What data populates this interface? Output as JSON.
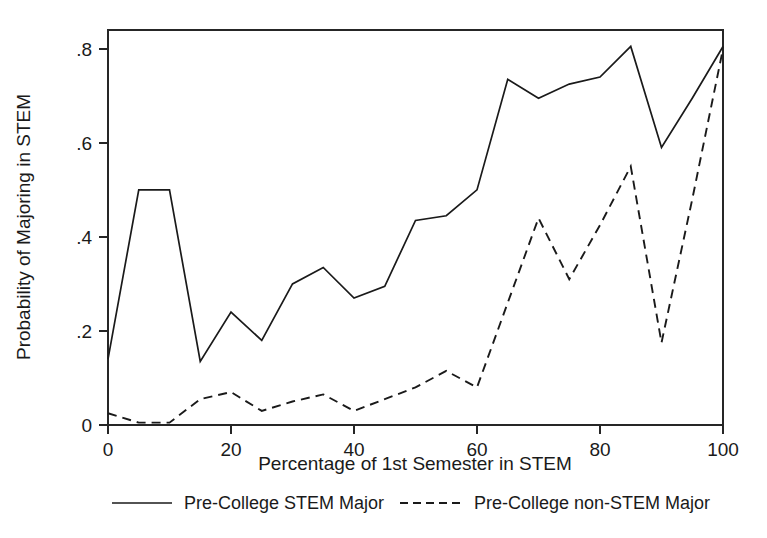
{
  "chart_data": {
    "type": "line",
    "title": "",
    "xlabel": "Percentage of 1st Semester in STEM",
    "ylabel": "Probability of Majoring in STEM",
    "xlim": [
      0,
      100
    ],
    "ylim": [
      0,
      0.84
    ],
    "grid": false,
    "legend_position": "bottom",
    "xticks": [
      0,
      20,
      40,
      60,
      80,
      100
    ],
    "xtick_labels": [
      "0",
      "20",
      "40",
      "60",
      "80",
      "100"
    ],
    "yticks": [
      0,
      0.2,
      0.4,
      0.6,
      0.8
    ],
    "ytick_labels": [
      "0",
      ".2",
      ".4",
      ".6",
      ".8"
    ],
    "x": [
      0,
      5,
      10,
      15,
      20,
      25,
      30,
      35,
      40,
      45,
      50,
      55,
      60,
      65,
      70,
      75,
      80,
      85,
      90,
      95,
      100
    ],
    "series": [
      {
        "name": "Pre-College STEM Major",
        "style": "solid",
        "values": [
          0.14,
          0.5,
          0.5,
          0.135,
          0.24,
          0.18,
          0.3,
          0.335,
          0.27,
          0.295,
          0.435,
          0.445,
          0.5,
          0.735,
          0.695,
          0.725,
          0.74,
          0.805,
          0.59,
          0.695,
          0.805
        ]
      },
      {
        "name": "Pre-College non-STEM Major",
        "style": "dashed",
        "values": [
          0.025,
          0.005,
          0.005,
          0.055,
          0.07,
          0.03,
          0.05,
          0.065,
          0.03,
          0.055,
          0.08,
          0.115,
          0.08,
          0.26,
          0.44,
          0.31,
          0.425,
          0.55,
          0.175,
          0.48,
          0.8
        ]
      }
    ]
  },
  "legend": {
    "entries": [
      {
        "label": "Pre-College STEM Major",
        "key": "solid-line-key"
      },
      {
        "label": "Pre-College non-STEM Major",
        "key": "dashed-line-key"
      }
    ]
  },
  "axes": {
    "x_title": "Percentage of 1st Semester in STEM",
    "y_title": "Probability of Majoring in STEM"
  }
}
